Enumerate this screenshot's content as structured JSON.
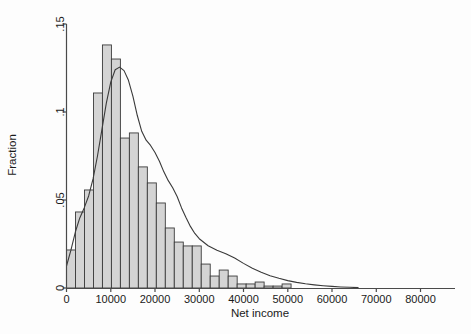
{
  "chart_data": {
    "type": "bar",
    "title": "",
    "subtitle": "",
    "xlabel": "Net income",
    "ylabel": "Fraction",
    "xlim": [
      -2000,
      88000
    ],
    "ylim": [
      0,
      0.15
    ],
    "xticks": [
      0,
      10000,
      20000,
      30000,
      40000,
      50000,
      60000,
      70000,
      80000
    ],
    "xtick_labels": [
      "0",
      "10000",
      "20000",
      "30000",
      "40000",
      "50000",
      "60000",
      "70000",
      "80000"
    ],
    "yticks": [
      0,
      0.05,
      0.1,
      0.15
    ],
    "ytick_labels": [
      "0",
      ".05",
      ".1",
      ".15"
    ],
    "grid": false,
    "legend": "none",
    "bin_width": 2030,
    "bin_starts": [
      0,
      2030,
      4060,
      6090,
      8120,
      10150,
      12180,
      14210,
      16240,
      18270,
      20300,
      22330,
      24360,
      26390,
      28420,
      30450,
      32480,
      34510,
      36540,
      38570,
      40600,
      42630,
      44660,
      46690,
      48720,
      50750,
      52780,
      54810,
      56840,
      58870,
      60900,
      62930
    ],
    "categories": [
      "0",
      "2030",
      "4060",
      "6090",
      "8120",
      "10150",
      "12180",
      "14210",
      "16240",
      "18270",
      "20300",
      "22330",
      "24360",
      "26390",
      "28420",
      "30450",
      "32480",
      "34510",
      "36540",
      "38570",
      "40600",
      "42630",
      "44660",
      "46690",
      "48720",
      "50750",
      "52780",
      "54810",
      "56840",
      "58870",
      "60900",
      "62930"
    ],
    "values": [
      0.0216,
      0.0432,
      0.0557,
      0.1108,
      0.1381,
      0.1301,
      0.0852,
      0.0881,
      0.0688,
      0.0597,
      0.0483,
      0.0341,
      0.0261,
      0.0239,
      0.0239,
      0.0136,
      0.0068,
      0.0102,
      0.0068,
      0.0023,
      0.0023,
      0.0034,
      0.0011,
      0.0011,
      0.0023,
      0.0,
      0.0,
      0.0,
      0.0,
      0.0,
      0.0,
      0.0
    ],
    "density_curve": {
      "name": "kernel density",
      "x": [
        0,
        1000,
        2000,
        3000,
        4000,
        5000,
        6000,
        7000,
        8000,
        9000,
        10000,
        11000,
        12000,
        13000,
        14000,
        15000,
        16000,
        17000,
        18000,
        19000,
        20000,
        21000,
        22000,
        23000,
        24000,
        25000,
        26000,
        27000,
        28000,
        29000,
        30000,
        32000,
        34000,
        36000,
        38000,
        40000,
        42000,
        44000,
        46000,
        48000,
        50000,
        52000,
        54000,
        56000,
        58000,
        60000,
        62000,
        64000,
        66000
      ],
      "y": [
        0.0125,
        0.0215,
        0.0318,
        0.0398,
        0.0455,
        0.0523,
        0.062,
        0.075,
        0.09,
        0.105,
        0.117,
        0.124,
        0.1255,
        0.1235,
        0.118,
        0.109,
        0.098,
        0.089,
        0.084,
        0.081,
        0.077,
        0.072,
        0.066,
        0.061,
        0.057,
        0.052,
        0.0455,
        0.04,
        0.035,
        0.031,
        0.028,
        0.024,
        0.0215,
        0.0195,
        0.017,
        0.014,
        0.0112,
        0.009,
        0.007,
        0.0055,
        0.0042,
        0.0032,
        0.0024,
        0.0018,
        0.0013,
        0.0009,
        0.0006,
        0.0004,
        0.0002
      ]
    },
    "colors": {
      "bar_fill": "#d4d4d4",
      "bar_stroke": "#3a3a3a",
      "curve": "#3a3a3a",
      "axis": "#4a4a4a",
      "text": "#1a1a1a",
      "background": "#fdfdfd"
    }
  }
}
